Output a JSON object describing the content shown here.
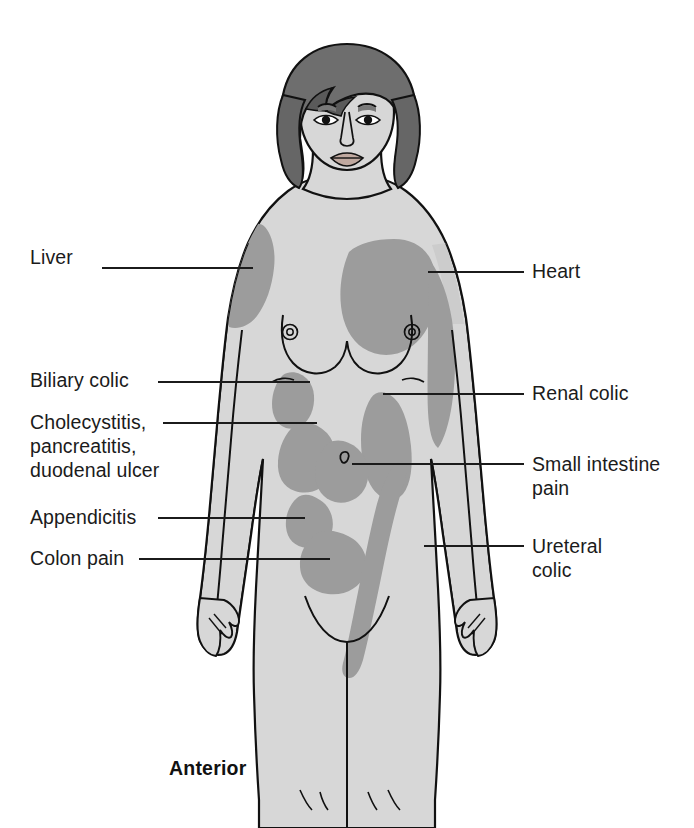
{
  "figure": {
    "caption": "Anterior",
    "view": "anterior"
  },
  "colors": {
    "background": "#ffffff",
    "skin": "#d7d7d7",
    "skin_shadow": "#c9c9c9",
    "pain_region": "#9c9c9c",
    "hair": "#6e6e6e",
    "hair_dark": "#5a5a5a",
    "outline": "#111111",
    "leader_line": "#1b1b1b",
    "text": "#1b1b1b"
  },
  "labels_left": [
    {
      "id": "liver",
      "text": "Liver",
      "x": 30,
      "y": 245,
      "line_y": 268,
      "line_x1": 102,
      "line_x2": 253
    },
    {
      "id": "biliary-colic",
      "text": "Biliary colic",
      "x": 30,
      "y": 368,
      "line_y": 382,
      "line_x1": 158,
      "line_x2": 310
    },
    {
      "id": "cholecystitis",
      "text": "Cholecystitis,\npancreatitis,\nduodenal ulcer",
      "x": 30,
      "y": 410,
      "line_y": 423,
      "line_x1": 163,
      "line_x2": 317
    },
    {
      "id": "appendicitis",
      "text": "Appendicitis",
      "x": 30,
      "y": 505,
      "line_y": 518,
      "line_x1": 158,
      "line_x2": 305
    },
    {
      "id": "colon-pain",
      "text": "Colon pain",
      "x": 30,
      "y": 546,
      "line_y": 559,
      "line_x1": 139,
      "line_x2": 330
    }
  ],
  "labels_right": [
    {
      "id": "heart",
      "text": "Heart",
      "x": 532,
      "y": 259,
      "line_y": 272,
      "line_x1": 428,
      "line_x2": 524
    },
    {
      "id": "renal-colic",
      "text": "Renal colic",
      "x": 532,
      "y": 381,
      "line_y": 394,
      "line_x1": 383,
      "line_x2": 524
    },
    {
      "id": "small-intestine",
      "text": "Small intestine\npain",
      "x": 532,
      "y": 452,
      "line_y": 464,
      "line_x1": 352,
      "line_x2": 524
    },
    {
      "id": "ureteral-colic",
      "text": "Ureteral\ncolic",
      "x": 532,
      "y": 534,
      "line_y": 546,
      "line_x1": 424,
      "line_x2": 524
    }
  ],
  "pain_regions": [
    {
      "id": "liver-region",
      "label": "Liver"
    },
    {
      "id": "heart-region",
      "label": "Heart"
    },
    {
      "id": "biliary-colic-region",
      "label": "Biliary colic"
    },
    {
      "id": "cholecystitis-region",
      "label": "Cholecystitis, pancreatitis, duodenal ulcer"
    },
    {
      "id": "renal-colic-region",
      "label": "Renal colic"
    },
    {
      "id": "small-intestine-region",
      "label": "Small intestine pain"
    },
    {
      "id": "appendicitis-region",
      "label": "Appendicitis"
    },
    {
      "id": "colon-pain-region",
      "label": "Colon pain"
    },
    {
      "id": "ureteral-colic-region",
      "label": "Ureteral colic"
    }
  ]
}
